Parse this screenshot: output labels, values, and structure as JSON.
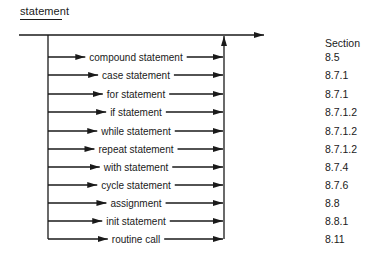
{
  "title": "statement",
  "section_header": "Section",
  "rows": [
    {
      "label": "compound statement",
      "section": "8.5"
    },
    {
      "label": "case statement",
      "section": "8.7.1"
    },
    {
      "label": "for statement",
      "section": "8.7.1"
    },
    {
      "label": "if statement",
      "section": "8.7.1.2"
    },
    {
      "label": "while statement",
      "section": "8.7.1.2"
    },
    {
      "label": "repeat statement",
      "section": "8.7.1.2"
    },
    {
      "label": "with statement",
      "section": "8.7.4"
    },
    {
      "label": "cycle statement",
      "section": "8.7.6"
    },
    {
      "label": "assignment",
      "section": "8.8"
    },
    {
      "label": "init statement",
      "section": "8.8.1"
    },
    {
      "label": "routine call",
      "section": "8.11"
    }
  ]
}
